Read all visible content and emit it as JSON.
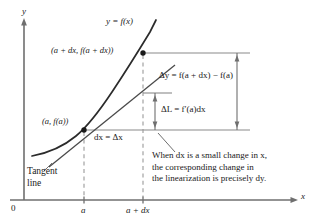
{
  "figure": {
    "type": "calculus-differential-diagram",
    "axes": {
      "y_label": "y",
      "x_label": "x",
      "origin_label": "0",
      "x_ticks": [
        {
          "label": "a",
          "x": 84
        },
        {
          "label": "a + dx",
          "x": 143
        }
      ]
    },
    "curve_label": "y = f(x)",
    "points": [
      {
        "name": "upper-point",
        "label": "(a + dx, f(a + dx))",
        "x": 143,
        "y": 53
      },
      {
        "name": "tangent-point",
        "label": "(a, f(a))",
        "x": 84,
        "y": 130
      }
    ],
    "annotations": {
      "dx_label": "dx = Δx",
      "delta_y_label": "Δy = f(a + dx) − f(a)",
      "delta_L_label": "ΔL = f′(a)dx",
      "tangent_line_label_1": "Tangent",
      "tangent_line_label_2": "line"
    },
    "caption": {
      "line1": "When dx is a small change in x,",
      "line2": "the corresponding change in",
      "line3": "the linearization is precisely dy."
    },
    "colors": {
      "ink": "#1a1a1a",
      "curve": "#2b2b2b",
      "guide": "#8a8a8a",
      "dashed": "#9a9a9a"
    }
  }
}
